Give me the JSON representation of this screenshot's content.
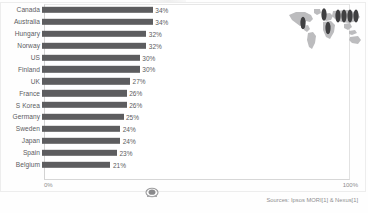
{
  "chart_data": {
    "type": "bar",
    "orientation": "horizontal",
    "title": "",
    "xlabel": "",
    "ylabel": "",
    "xlim": [
      0,
      100
    ],
    "grid": false,
    "legend": null,
    "categories": [
      "Canada",
      "Australia",
      "Hungary",
      "Norway",
      "US",
      "Finland",
      "UK",
      "France",
      "S Korea",
      "Germany",
      "Sweden",
      "Japan",
      "Spain",
      "Belgium"
    ],
    "values": [
      34,
      34,
      32,
      32,
      30,
      30,
      27,
      26,
      26,
      25,
      24,
      24,
      23,
      21
    ],
    "value_labels": [
      "34%",
      "34%",
      "32%",
      "32%",
      "30%",
      "30%",
      "27%",
      "26%",
      "26%",
      "25%",
      "24%",
      "24%",
      "23%",
      "21%"
    ],
    "bar_color": "#5d5d5f",
    "rows": [
      {
        "label": "Canada",
        "value": 34,
        "value_label": "34%"
      },
      {
        "label": "Australia",
        "value": 34,
        "value_label": "34%"
      },
      {
        "label": "Hungary",
        "value": 32,
        "value_label": "32%"
      },
      {
        "label": "Norway",
        "value": 32,
        "value_label": "32%"
      },
      {
        "label": "US",
        "value": 30,
        "value_label": "30%"
      },
      {
        "label": "Finland",
        "value": 30,
        "value_label": "30%"
      },
      {
        "label": "UK",
        "value": 27,
        "value_label": "27%"
      },
      {
        "label": "France",
        "value": 26,
        "value_label": "26%"
      },
      {
        "label": "S Korea",
        "value": 26,
        "value_label": "26%"
      },
      {
        "label": "Germany",
        "value": 25,
        "value_label": "25%"
      },
      {
        "label": "Sweden",
        "value": 24,
        "value_label": "24%"
      },
      {
        "label": "Japan",
        "value": 24,
        "value_label": "24%"
      },
      {
        "label": "Spain",
        "value": 23,
        "value_label": "23%"
      },
      {
        "label": "Belgium",
        "value": 21,
        "value_label": "21%"
      }
    ]
  },
  "axis": {
    "min_label": "0%",
    "max_label": "100%"
  },
  "footer": {
    "source": "Sources: Ipsos MORI[1] & Nexus[1]"
  },
  "map": {
    "icon_name": "world-map-thumbnail",
    "marker_color": "#3f3f41",
    "land_color": "#b9b9bb"
  },
  "center_icon": {
    "icon_name": "stamp-icon"
  },
  "colors": {
    "bar": "#5d5d5f",
    "text": "#5c5c5e",
    "axis_text": "#8d8d8f",
    "frame": "#d7d7d7",
    "background": "#ffffff"
  }
}
